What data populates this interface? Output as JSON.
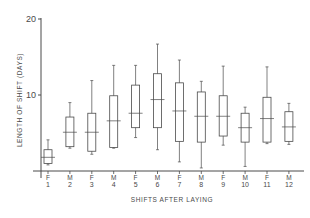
{
  "chart_data": {
    "type": "boxplot",
    "title": "",
    "xlabel": "SHIFTS AFTER LAYING",
    "ylabel": "LENGTH OF SHIFT (DAYS)",
    "ylim": [
      0,
      20
    ],
    "yticks": [
      10,
      20
    ],
    "grid": false,
    "legend": null,
    "categories": [
      {
        "sex": "F",
        "shift": "1"
      },
      {
        "sex": "M",
        "shift": "2"
      },
      {
        "sex": "F",
        "shift": "3"
      },
      {
        "sex": "M",
        "shift": "4"
      },
      {
        "sex": "F",
        "shift": "5"
      },
      {
        "sex": "M",
        "shift": "6"
      },
      {
        "sex": "F",
        "shift": "7"
      },
      {
        "sex": "M",
        "shift": "8"
      },
      {
        "sex": "F",
        "shift": "9"
      },
      {
        "sex": "M",
        "shift": "10"
      },
      {
        "sex": "F",
        "shift": "11"
      },
      {
        "sex": "M",
        "shift": "12"
      }
    ],
    "series": [
      {
        "name": "Length of shift",
        "boxes": [
          {
            "min": 0.8,
            "q1": 1.0,
            "median": 1.8,
            "q3": 2.8,
            "max": 4.1
          },
          {
            "min": 3.0,
            "q1": 3.2,
            "median": 5.1,
            "q3": 7.1,
            "max": 9.0
          },
          {
            "min": 2.2,
            "q1": 2.6,
            "median": 5.1,
            "q3": 7.6,
            "max": 11.9
          },
          {
            "min": 3.0,
            "q1": 3.1,
            "median": 6.6,
            "q3": 9.9,
            "max": 13.9
          },
          {
            "min": 4.4,
            "q1": 5.7,
            "median": 7.6,
            "q3": 11.3,
            "max": 13.9
          },
          {
            "min": 2.8,
            "q1": 5.7,
            "median": 9.4,
            "q3": 12.8,
            "max": 16.7
          },
          {
            "min": 1.2,
            "q1": 3.9,
            "median": 7.9,
            "q3": 11.6,
            "max": 14.6
          },
          {
            "min": 0.4,
            "q1": 3.8,
            "median": 7.2,
            "q3": 10.4,
            "max": 11.8
          },
          {
            "min": 3.4,
            "q1": 4.6,
            "median": 7.2,
            "q3": 9.9,
            "max": 13.8
          },
          {
            "min": 0.6,
            "q1": 3.8,
            "median": 5.7,
            "q3": 7.6,
            "max": 8.4
          },
          {
            "min": 3.6,
            "q1": 3.8,
            "median": 6.9,
            "q3": 9.7,
            "max": 13.7
          },
          {
            "min": 3.5,
            "q1": 3.9,
            "median": 5.8,
            "q3": 7.8,
            "max": 8.9
          }
        ]
      }
    ]
  },
  "labels": {
    "y_tick_20": "20",
    "y_tick_10": "10",
    "y_axis": "LENGTH OF SHIFT (DAYS)",
    "x_axis": "SHIFTS AFTER LAYING"
  },
  "style": {
    "ink": "#4a4a4a",
    "background": "#ffffff"
  }
}
